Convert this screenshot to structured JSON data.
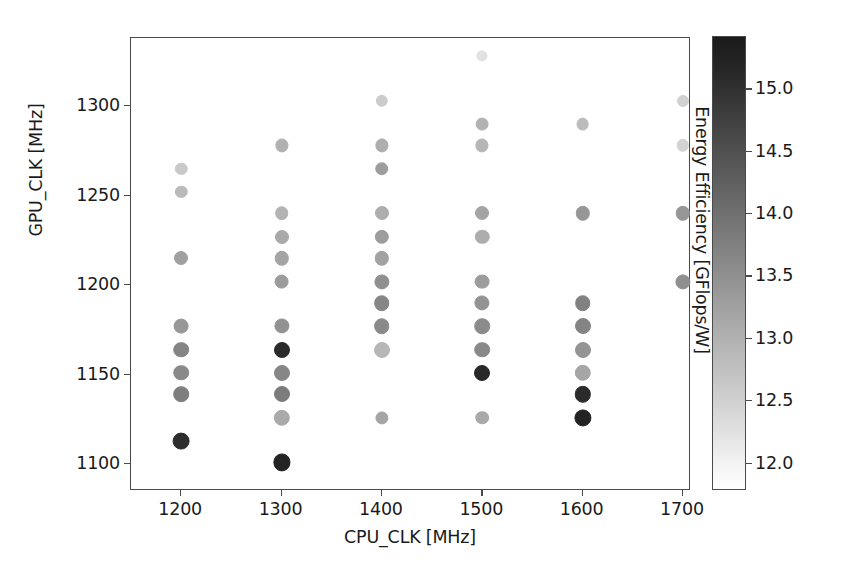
{
  "chart_data": {
    "type": "scatter",
    "title": "",
    "xlabel": "CPU_CLK [MHz]",
    "ylabel": "GPU_CLK [MHz]",
    "xlim": [
      1150,
      1708
    ],
    "ylim": [
      1085,
      1338
    ],
    "xticks": [
      1200,
      1300,
      1400,
      1500,
      1600,
      1700
    ],
    "xticklabels": [
      "1200",
      "1300",
      "1400",
      "1500",
      "1600",
      "1700"
    ],
    "yticks": [
      1100,
      1150,
      1200,
      1250,
      1300
    ],
    "yticklabels": [
      "1100",
      "1150",
      "1200",
      "1250",
      "1300"
    ],
    "grid": false,
    "legend": null,
    "colormap": "greys",
    "colorbar": {
      "label": "Energy Efficiency [GFlops/W]",
      "ticks": [
        12.0,
        12.5,
        13.0,
        13.5,
        14.0,
        14.5,
        15.0
      ],
      "ticklabels": [
        "12.0",
        "12.5",
        "13.0",
        "13.5",
        "14.0",
        "14.5",
        "15.0"
      ],
      "vmin": 11.78,
      "vmax": 15.42,
      "low_color": "#ffffff",
      "high_color": "#1b1b1b",
      "orientation": "vertical"
    },
    "marker": "circle",
    "color_variable": "Energy Efficiency [GFlops/W]",
    "points": [
      {
        "x": 1200,
        "y": 1265,
        "c": 12.62,
        "r": 5.2
      },
      {
        "x": 1200,
        "y": 1252,
        "c": 12.86,
        "r": 5.2
      },
      {
        "x": 1200,
        "y": 1215,
        "c": 13.26,
        "r": 6.0
      },
      {
        "x": 1200,
        "y": 1177,
        "c": 13.4,
        "r": 6.4
      },
      {
        "x": 1200,
        "y": 1164,
        "c": 13.7,
        "r": 6.8
      },
      {
        "x": 1200,
        "y": 1151,
        "c": 13.62,
        "r": 6.8
      },
      {
        "x": 1200,
        "y": 1139,
        "c": 13.78,
        "r": 6.8
      },
      {
        "x": 1200,
        "y": 1113,
        "c": 15.05,
        "r": 7.4
      },
      {
        "x": 1300,
        "y": 1278,
        "c": 13.0,
        "r": 5.6
      },
      {
        "x": 1300,
        "y": 1240,
        "c": 12.96,
        "r": 5.8
      },
      {
        "x": 1300,
        "y": 1227,
        "c": 13.12,
        "r": 6.0
      },
      {
        "x": 1300,
        "y": 1215,
        "c": 13.2,
        "r": 6.2
      },
      {
        "x": 1300,
        "y": 1202,
        "c": 13.34,
        "r": 6.4
      },
      {
        "x": 1300,
        "y": 1177,
        "c": 13.48,
        "r": 6.6
      },
      {
        "x": 1300,
        "y": 1164,
        "c": 15.1,
        "r": 7.0
      },
      {
        "x": 1300,
        "y": 1151,
        "c": 13.66,
        "r": 7.0
      },
      {
        "x": 1300,
        "y": 1139,
        "c": 13.82,
        "r": 7.0
      },
      {
        "x": 1300,
        "y": 1126,
        "c": 13.1,
        "r": 7.2
      },
      {
        "x": 1300,
        "y": 1101,
        "c": 15.18,
        "r": 7.6
      },
      {
        "x": 1400,
        "y": 1303,
        "c": 12.58,
        "r": 5.2
      },
      {
        "x": 1400,
        "y": 1278,
        "c": 13.04,
        "r": 5.6
      },
      {
        "x": 1400,
        "y": 1265,
        "c": 13.3,
        "r": 5.8
      },
      {
        "x": 1400,
        "y": 1240,
        "c": 13.06,
        "r": 6.0
      },
      {
        "x": 1400,
        "y": 1227,
        "c": 13.3,
        "r": 6.2
      },
      {
        "x": 1400,
        "y": 1215,
        "c": 13.22,
        "r": 6.2
      },
      {
        "x": 1400,
        "y": 1202,
        "c": 13.52,
        "r": 6.6
      },
      {
        "x": 1400,
        "y": 1190,
        "c": 13.66,
        "r": 6.8
      },
      {
        "x": 1400,
        "y": 1177,
        "c": 13.6,
        "r": 6.8
      },
      {
        "x": 1400,
        "y": 1164,
        "c": 12.9,
        "r": 7.0
      },
      {
        "x": 1400,
        "y": 1126,
        "c": 13.18,
        "r": 5.6
      },
      {
        "x": 1500,
        "y": 1328,
        "c": 12.24,
        "r": 4.6
      },
      {
        "x": 1500,
        "y": 1290,
        "c": 12.98,
        "r": 5.4
      },
      {
        "x": 1500,
        "y": 1278,
        "c": 12.92,
        "r": 5.6
      },
      {
        "x": 1500,
        "y": 1240,
        "c": 13.2,
        "r": 6.0
      },
      {
        "x": 1500,
        "y": 1227,
        "c": 13.06,
        "r": 6.2
      },
      {
        "x": 1500,
        "y": 1202,
        "c": 13.32,
        "r": 6.4
      },
      {
        "x": 1500,
        "y": 1190,
        "c": 13.46,
        "r": 6.6
      },
      {
        "x": 1500,
        "y": 1177,
        "c": 13.58,
        "r": 6.8
      },
      {
        "x": 1500,
        "y": 1164,
        "c": 13.62,
        "r": 6.8
      },
      {
        "x": 1500,
        "y": 1151,
        "c": 15.12,
        "r": 7.0
      },
      {
        "x": 1500,
        "y": 1126,
        "c": 13.12,
        "r": 5.8
      },
      {
        "x": 1600,
        "y": 1290,
        "c": 12.82,
        "r": 5.4
      },
      {
        "x": 1600,
        "y": 1240,
        "c": 13.4,
        "r": 6.2
      },
      {
        "x": 1600,
        "y": 1190,
        "c": 13.74,
        "r": 6.8
      },
      {
        "x": 1600,
        "y": 1177,
        "c": 13.7,
        "r": 7.0
      },
      {
        "x": 1600,
        "y": 1164,
        "c": 13.44,
        "r": 7.0
      },
      {
        "x": 1600,
        "y": 1151,
        "c": 13.16,
        "r": 7.2
      },
      {
        "x": 1600,
        "y": 1139,
        "c": 15.08,
        "r": 7.2
      },
      {
        "x": 1600,
        "y": 1126,
        "c": 15.2,
        "r": 7.6
      },
      {
        "x": 1700,
        "y": 1303,
        "c": 12.5,
        "r": 5.0
      },
      {
        "x": 1700,
        "y": 1278,
        "c": 12.46,
        "r": 5.2
      },
      {
        "x": 1700,
        "y": 1240,
        "c": 13.42,
        "r": 6.2
      },
      {
        "x": 1700,
        "y": 1202,
        "c": 13.52,
        "r": 6.6
      }
    ]
  }
}
